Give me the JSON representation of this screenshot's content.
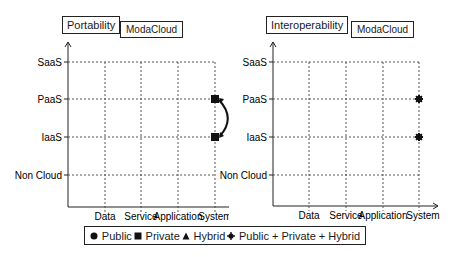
{
  "panels": [
    {
      "title": "Portability",
      "subtitle": "ModaCloud",
      "y_levels": [
        "SaaS",
        "PaaS",
        "IaaS",
        "Non Cloud"
      ],
      "x_levels": [
        "Data",
        "Service",
        "Application",
        "System"
      ],
      "points": [
        {
          "x": "System",
          "y": "PaaS",
          "marker": "square"
        },
        {
          "x": "System",
          "y": "IaaS",
          "marker": "square"
        }
      ],
      "connector": {
        "from": "PaaS",
        "to": "IaaS",
        "at": "System",
        "style": "curved double-headed arrow"
      }
    },
    {
      "title": "Interoperability",
      "subtitle": "ModaCloud",
      "y_levels": [
        "SaaS",
        "PaaS",
        "IaaS",
        "Non Cloud"
      ],
      "x_levels": [
        "Data",
        "Service",
        "Application",
        "System"
      ],
      "points": [
        {
          "x": "System",
          "y": "PaaS",
          "marker": "star"
        },
        {
          "x": "System",
          "y": "IaaS",
          "marker": "star"
        }
      ]
    }
  ],
  "legend": [
    {
      "symbol": "circle",
      "label": "Public"
    },
    {
      "symbol": "square",
      "label": "Private"
    },
    {
      "symbol": "triangle",
      "label": "Hybrid"
    },
    {
      "symbol": "star",
      "label": "Public + Private + Hybrid"
    }
  ],
  "colors": {
    "ink": "#1a1a1a",
    "grid": "#444444"
  }
}
